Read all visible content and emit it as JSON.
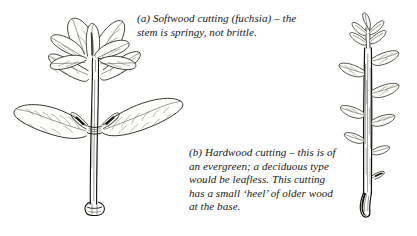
{
  "figure": {
    "background_color": "#ffffff",
    "ink_color": "#15150f",
    "style": "pen-and-ink botanical line drawing"
  },
  "captions": {
    "a": {
      "label": "(a)",
      "text": "(a) Softwood cutting (fuchsia) – the stem is springy, not brittle.",
      "lines": [
        "(a) Softwood cutting (fuchsia) – the",
        "stem is springy, not brittle."
      ]
    },
    "b": {
      "label": "(b)",
      "text": "(b) Hardwood cutting – this is of an evergreen; a deciduous type would be leafless. This cutting has a small ‘heel’ of older wood at the base.",
      "lines": [
        "(b) Hardwood cutting – this is",
        "of an evergreen; a deciduous",
        "type would be leafless. This",
        "cutting has a small ‘heel’ of",
        "older wood at the base."
      ]
    }
  },
  "illustrations": {
    "softwood": {
      "name": "softwood-cutting",
      "subject": "fuchsia softwood cutting",
      "parts": [
        "apex rosette of soft crinkled young leaves",
        "pair of opposite spreading leaves at node",
        "small axillary shoots at node",
        "smooth springy stem",
        "swollen basal node with clean cut"
      ]
    },
    "hardwood": {
      "name": "hardwood-cutting",
      "subject": "evergreen hardwood cutting",
      "parts": [
        "leafy shoot tip",
        "upright woody stem",
        "alternate narrow pointed leaves",
        "small heel of older wood at the base"
      ]
    }
  }
}
